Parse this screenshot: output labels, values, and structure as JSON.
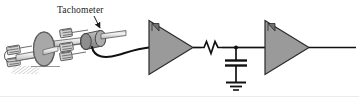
{
  "figure": {
    "background_color": "#ffffff",
    "width": 359,
    "height": 99,
    "border_color": "#e8e8e8"
  },
  "labels": {
    "tachometer": "Tachometer"
  },
  "colors": {
    "line": "#1a1a1a",
    "shape_fill": "#9a9a9a",
    "shape_fill_light": "#b8b8b8",
    "shape_fill_dark": "#7d7d7d",
    "disc_fill": "#a0a0a0",
    "shaft_fill": "#e6e6e6",
    "hatch": "#9e9e9e",
    "text": "#1a1a1a"
  },
  "components": [
    {
      "id": "motor-flywheel",
      "name": "motor-flywheel-disc",
      "type": "mechanical",
      "label": ""
    },
    {
      "id": "shaft",
      "name": "drive-shaft",
      "type": "mechanical",
      "label": ""
    },
    {
      "id": "spring-coils",
      "name": "spring-coil-bundle",
      "type": "mechanical",
      "label": ""
    },
    {
      "id": "tachometer",
      "name": "tachometer-body",
      "type": "sensor",
      "label": "Tachometer"
    },
    {
      "id": "amplifier-1",
      "name": "amplifier-triangle-1",
      "type": "amplifier",
      "label": ""
    },
    {
      "id": "resistor-1",
      "name": "resistor-zigzag",
      "type": "resistor",
      "label": ""
    },
    {
      "id": "capacitor-1",
      "name": "capacitor-plates",
      "type": "capacitor",
      "label": ""
    },
    {
      "id": "ground-1",
      "name": "ground-symbol",
      "type": "ground",
      "label": ""
    },
    {
      "id": "amplifier-2",
      "name": "amplifier-triangle-2",
      "type": "amplifier",
      "label": ""
    },
    {
      "id": "output-wire",
      "name": "output-wire",
      "type": "wire",
      "label": ""
    }
  ]
}
